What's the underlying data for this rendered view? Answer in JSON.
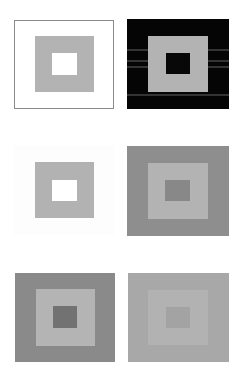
{
  "figure": {
    "panels": [
      {
        "id": "panel-1",
        "row": 1,
        "column": 1,
        "outer_color": "#ffffff",
        "outer_border_color": "#8a8a8a",
        "middle_color": "#b3b3b3",
        "inner_color": "#ffffff"
      },
      {
        "id": "panel-2",
        "row": 1,
        "column": 2,
        "outer_color": "#050505",
        "middle_color": "#b3b3b3",
        "inner_color": "#080808"
      },
      {
        "id": "panel-3",
        "row": 2,
        "column": 1,
        "outer_color": "#fdfdfd",
        "middle_color": "#b2b2b2",
        "inner_color": "#ffffff"
      },
      {
        "id": "panel-4",
        "row": 2,
        "column": 2,
        "outer_color": "#8e8e8e",
        "middle_color": "#b3b3b3",
        "inner_color": "#888888"
      },
      {
        "id": "panel-5",
        "row": 3,
        "column": 1,
        "outer_color": "#8a8a8a",
        "middle_color": "#b4b4b4",
        "inner_color": "#727272"
      },
      {
        "id": "panel-6",
        "row": 3,
        "column": 2,
        "outer_color": "#a8a8a8",
        "middle_color": "#b2b2b2",
        "inner_color": "#a3a3a3"
      }
    ]
  }
}
